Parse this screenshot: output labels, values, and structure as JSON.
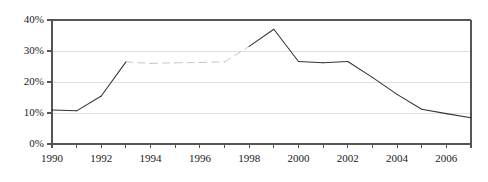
{
  "chart_data": {
    "type": "line",
    "title": "",
    "subtitle": "",
    "xlabel": "",
    "ylabel": "",
    "xlim": [
      1990,
      2007
    ],
    "ylim": [
      0,
      40
    ],
    "y_unit": "%",
    "grid": true,
    "grid_axis": "y",
    "legend": false,
    "legend_position": "none",
    "y_ticks": [
      0,
      10,
      20,
      30,
      40
    ],
    "y_tick_labels": [
      "0%",
      "10%",
      "20%",
      "30%",
      "40%"
    ],
    "x_ticks": [
      1990,
      1991,
      1992,
      1993,
      1994,
      1995,
      1996,
      1997,
      1998,
      1999,
      2000,
      2001,
      2002,
      2003,
      2004,
      2005,
      2006,
      2007
    ],
    "x_tick_labels_shown": [
      "1990",
      "1992",
      "1994",
      "1996",
      "1998",
      "2000",
      "2002",
      "2004",
      "2006"
    ],
    "x_tick_labels_shown_values": [
      1990,
      1992,
      1994,
      1996,
      1998,
      2000,
      2002,
      2004,
      2006
    ],
    "x": [
      1990,
      1991,
      1992,
      1993,
      1994,
      1995,
      1996,
      1997,
      1998,
      1999,
      2000,
      2001,
      2002,
      2003,
      2004,
      2005,
      2006,
      2007
    ],
    "values": [
      11.0,
      10.7,
      15.5,
      26.5,
      26.0,
      26.2,
      26.3,
      26.5,
      31.5,
      37.0,
      26.6,
      26.2,
      26.6,
      21.5,
      16.0,
      11.2,
      9.8,
      8.5
    ],
    "series": [
      {
        "name": "",
        "color": "#333333",
        "values": [
          11.0,
          10.7,
          15.5,
          26.5,
          26.0,
          26.2,
          26.3,
          26.5,
          31.5,
          37.0,
          26.6,
          26.2,
          26.6,
          21.5,
          16.0,
          11.2,
          9.8,
          8.5
        ]
      }
    ],
    "faded_segments": [
      {
        "from": 1993,
        "to": 1998,
        "note": "line rendered faintly / broken"
      }
    ],
    "annotations": []
  },
  "style": {
    "line_color": "#333333",
    "faded_line_color": "#8f8f8f",
    "axis_color": "#555555",
    "grid_color": "#e0e0e0",
    "text_color": "#1a1a1a",
    "background": "#ffffff"
  },
  "axes": {
    "y_labels": [
      {
        "text": "40%",
        "value": 40
      },
      {
        "text": "30%",
        "value": 30
      },
      {
        "text": "20%",
        "value": 20
      },
      {
        "text": "10%",
        "value": 10
      },
      {
        "text": "0%",
        "value": 0
      }
    ],
    "x_labels": [
      {
        "text": "1990",
        "value": 1990
      },
      {
        "text": "1992",
        "value": 1992
      },
      {
        "text": "1994",
        "value": 1994
      },
      {
        "text": "1996",
        "value": 1996
      },
      {
        "text": "1998",
        "value": 1998
      },
      {
        "text": "2000",
        "value": 2000
      },
      {
        "text": "2002",
        "value": 2002
      },
      {
        "text": "2004",
        "value": 2004
      },
      {
        "text": "2006",
        "value": 2006
      }
    ]
  }
}
